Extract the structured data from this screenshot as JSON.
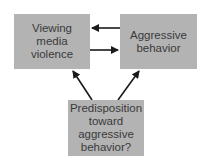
{
  "diagram": {
    "nodes": [
      {
        "id": "viewing",
        "label": "Viewing media violence",
        "lines": [
          "Viewing",
          "media",
          "violence"
        ]
      },
      {
        "id": "aggressive",
        "label": "Aggressive behavior",
        "lines": [
          "Aggressive",
          "behavior"
        ]
      },
      {
        "id": "predisposition",
        "label": "Predisposition toward aggressive behavior?",
        "lines": [
          "Predisposition",
          "toward",
          "aggressive",
          "behavior?"
        ]
      }
    ],
    "edges": [
      {
        "from": "aggressive",
        "to": "viewing"
      },
      {
        "from": "viewing",
        "to": "aggressive"
      },
      {
        "from": "predisposition",
        "to": "viewing"
      },
      {
        "from": "predisposition",
        "to": "aggressive"
      }
    ],
    "colors": {
      "box": "#b3b3b3",
      "arrow": "#1a1a1a",
      "text": "#3a3a3a"
    }
  }
}
